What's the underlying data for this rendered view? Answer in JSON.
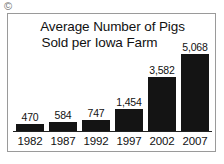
{
  "corner_mark": {
    "glyph": "©",
    "name": "copyright-mark"
  },
  "chart_data": {
    "type": "bar",
    "title": "Average Number of Pigs Sold per Iowa Farm",
    "title_lines": [
      "Average Number of Pigs",
      "Sold per Iowa Farm"
    ],
    "xlabel": "",
    "ylabel": "",
    "categories": [
      "1982",
      "1987",
      "1992",
      "1997",
      "2002",
      "2007"
    ],
    "values": [
      470,
      584,
      747,
      1454,
      3582,
      5068
    ],
    "value_labels": [
      "470",
      "584",
      "747",
      "1,454",
      "3,582",
      "5,068"
    ],
    "ylim": [
      0,
      5068
    ],
    "grid": false,
    "legend": false,
    "bar_color": "#141414",
    "background_color": "#ffffff",
    "border_color": "#9a9a9a",
    "text_color": "#111111"
  }
}
